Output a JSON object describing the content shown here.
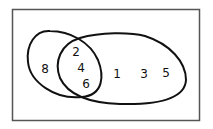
{
  "diagram": {
    "type": "venn",
    "universe": {
      "label": ""
    },
    "sets": [
      {
        "name": "left-set",
        "elements_only": [
          "8"
        ]
      },
      {
        "name": "right-set",
        "elements_only": [
          "1",
          "3",
          "5"
        ]
      }
    ],
    "intersection": [
      "2",
      "4",
      "6"
    ],
    "labels": {
      "n8": "8",
      "n2": "2",
      "n4": "4",
      "n6": "6",
      "n1": "1",
      "n3": "3",
      "n5": "5"
    }
  }
}
